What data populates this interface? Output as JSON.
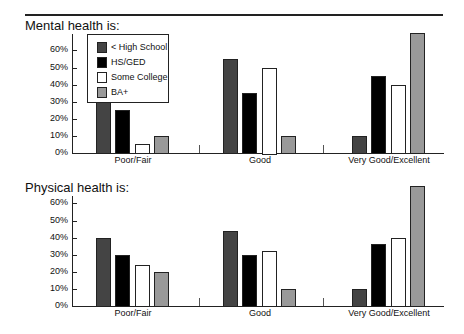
{
  "legend": [
    {
      "label": "< High School",
      "color": "#444444"
    },
    {
      "label": "HS/GED",
      "color": "#000000"
    },
    {
      "label": "Some College",
      "color": "#ffffff"
    },
    {
      "label": "BA+",
      "color": "#999999"
    }
  ],
  "y_ticks": [
    "0%",
    "10%",
    "20%",
    "30%",
    "40%",
    "50%",
    "60%"
  ],
  "chart_data": [
    {
      "type": "bar",
      "title": "Mental health is:",
      "categories": [
        "Poor/Fair",
        "Good",
        "Very Good/Excellent"
      ],
      "series": [
        {
          "name": "< High School",
          "values": [
            30,
            55,
            10
          ]
        },
        {
          "name": "HS/GED",
          "values": [
            25,
            35,
            45
          ]
        },
        {
          "name": "Some College",
          "values": [
            5,
            50,
            40
          ]
        },
        {
          "name": "BA+",
          "values": [
            10,
            10,
            70
          ]
        }
      ],
      "xlabel": "",
      "ylabel": "",
      "ylim": [
        0,
        70
      ],
      "legend_position": "upper-left-inside",
      "grid": false
    },
    {
      "type": "bar",
      "title": "Physical health is:",
      "categories": [
        "Poor/Fair",
        "Good",
        "Very Good/Excellent"
      ],
      "series": [
        {
          "name": "< High School",
          "values": [
            40,
            44,
            10
          ]
        },
        {
          "name": "HS/GED",
          "values": [
            30,
            30,
            36
          ]
        },
        {
          "name": "Some College",
          "values": [
            24,
            32,
            40
          ]
        },
        {
          "name": "BA+",
          "values": [
            20,
            10,
            70
          ]
        }
      ],
      "xlabel": "",
      "ylabel": "",
      "ylim": [
        0,
        70
      ],
      "grid": false
    }
  ]
}
